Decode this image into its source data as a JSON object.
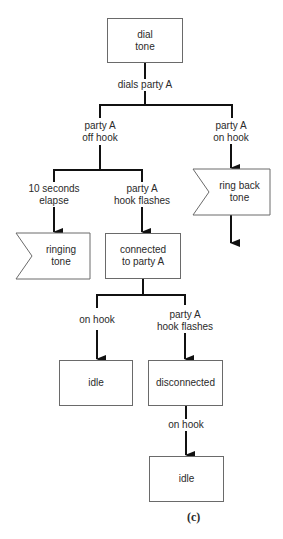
{
  "diagram": {
    "nodes": {
      "dial_tone": "dial\ntone",
      "ringing_tone": "ringing\ntone",
      "connected": "connected\nto party A",
      "ring_back_tone": "ring back\ntone",
      "idle_1": "idle",
      "disconnected": "disconnected",
      "idle_2": "idle"
    },
    "edges": {
      "dials_party_a": "dials party A",
      "party_a_off_hook": "party A\noff hook",
      "party_a_on_hook": "party A\non hook",
      "ten_seconds_elapse": "10 seconds\nelapse",
      "party_a_hook_flashes_1": "party A\nhook flashes",
      "on_hook_1": "on hook",
      "party_a_hook_flashes_2": "party A\nhook flashes",
      "on_hook_2": "on hook"
    },
    "caption": "(c)"
  }
}
